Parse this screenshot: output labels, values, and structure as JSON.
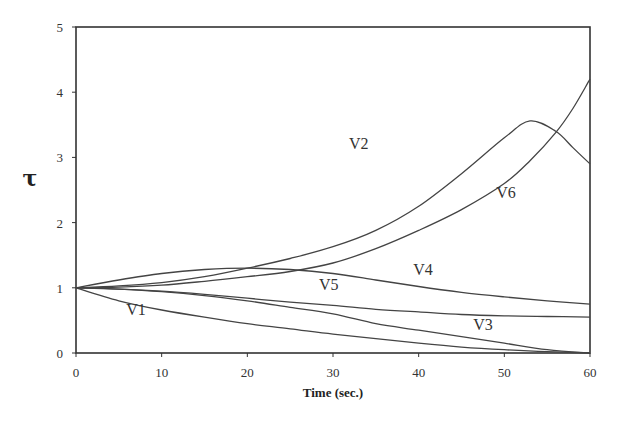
{
  "chart_data": {
    "type": "line",
    "title": "",
    "xlabel": "Time (sec.)",
    "ylabel": "τ",
    "xlim": [
      0,
      60
    ],
    "ylim": [
      0,
      5
    ],
    "xticks": [
      0,
      10,
      20,
      30,
      40,
      50,
      60
    ],
    "yticks": [
      0,
      1,
      2,
      3,
      4,
      5
    ],
    "grid": false,
    "legend": "inline labels",
    "series": [
      {
        "name": "V1",
        "x": [
          0,
          5,
          10,
          15,
          20,
          25,
          30,
          35,
          40,
          45,
          50,
          55,
          60
        ],
        "values": [
          1.0,
          0.8,
          0.66,
          0.55,
          0.45,
          0.37,
          0.29,
          0.22,
          0.15,
          0.09,
          0.05,
          0.02,
          0.0
        ],
        "label_pos": [
          7,
          0.58
        ]
      },
      {
        "name": "V2",
        "x": [
          0,
          5,
          10,
          15,
          20,
          25,
          30,
          35,
          40,
          45,
          50,
          53,
          56,
          58,
          60
        ],
        "values": [
          1.0,
          1.03,
          1.08,
          1.17,
          1.3,
          1.45,
          1.63,
          1.88,
          2.25,
          2.75,
          3.3,
          3.56,
          3.4,
          3.15,
          2.9
        ],
        "label_pos": [
          33,
          3.13
        ]
      },
      {
        "name": "V3",
        "x": [
          0,
          5,
          10,
          15,
          20,
          25,
          30,
          35,
          40,
          45,
          50,
          55,
          60
        ],
        "values": [
          1.0,
          0.98,
          0.94,
          0.88,
          0.8,
          0.7,
          0.6,
          0.45,
          0.35,
          0.25,
          0.15,
          0.05,
          0.0
        ],
        "label_pos": [
          47.5,
          0.35
        ]
      },
      {
        "name": "V4",
        "x": [
          0,
          5,
          10,
          15,
          20,
          25,
          30,
          35,
          40,
          45,
          50,
          55,
          60
        ],
        "values": [
          1.0,
          1.12,
          1.22,
          1.28,
          1.3,
          1.28,
          1.22,
          1.12,
          1.02,
          0.93,
          0.86,
          0.8,
          0.75
        ],
        "label_pos": [
          40.5,
          1.2
        ]
      },
      {
        "name": "V5",
        "x": [
          0,
          5,
          10,
          15,
          20,
          25,
          30,
          35,
          40,
          45,
          50,
          55,
          60
        ],
        "values": [
          1.0,
          0.98,
          0.95,
          0.9,
          0.84,
          0.78,
          0.73,
          0.67,
          0.63,
          0.59,
          0.57,
          0.56,
          0.55
        ],
        "label_pos": [
          29.5,
          0.96
        ]
      },
      {
        "name": "V6",
        "x": [
          0,
          5,
          10,
          15,
          20,
          25,
          30,
          35,
          40,
          45,
          50,
          53,
          56,
          58,
          60
        ],
        "values": [
          1.0,
          1.01,
          1.04,
          1.1,
          1.17,
          1.25,
          1.38,
          1.6,
          1.88,
          2.2,
          2.6,
          2.95,
          3.38,
          3.75,
          4.2
        ],
        "label_pos": [
          50.2,
          2.38
        ]
      }
    ]
  }
}
